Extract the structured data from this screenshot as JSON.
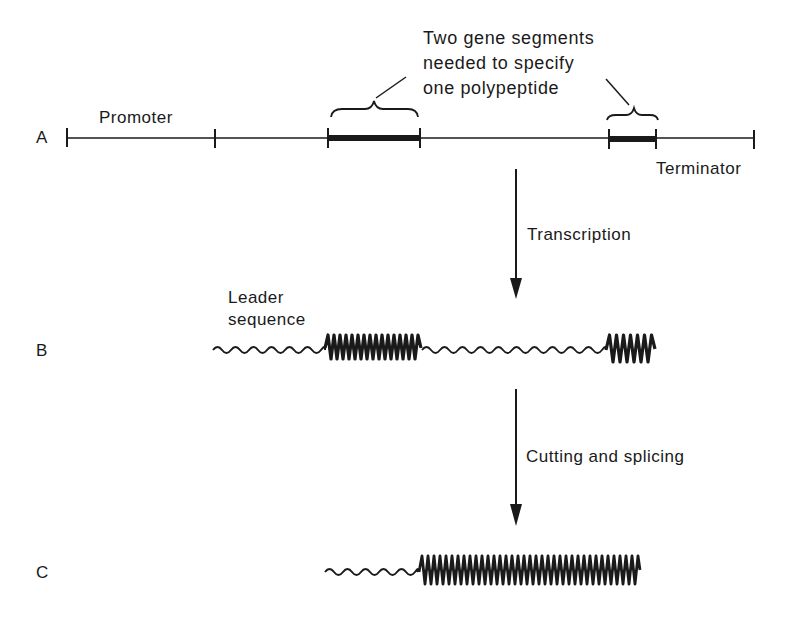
{
  "rows": {
    "a": {
      "label": "A"
    },
    "b": {
      "label": "B"
    },
    "c": {
      "label": "C"
    }
  },
  "annotations": {
    "promoter": "Promoter",
    "terminator": "Terminator",
    "gene_segments_note": [
      "Two gene segments",
      "needed to specify",
      "one polypeptide"
    ],
    "leader_sequence": [
      "Leader",
      "sequence"
    ]
  },
  "steps": {
    "transcription": "Transcription",
    "cutting_splicing": "Cutting and splicing"
  },
  "colors": {
    "ink": "#1a1a1a",
    "background": "#ffffff"
  }
}
